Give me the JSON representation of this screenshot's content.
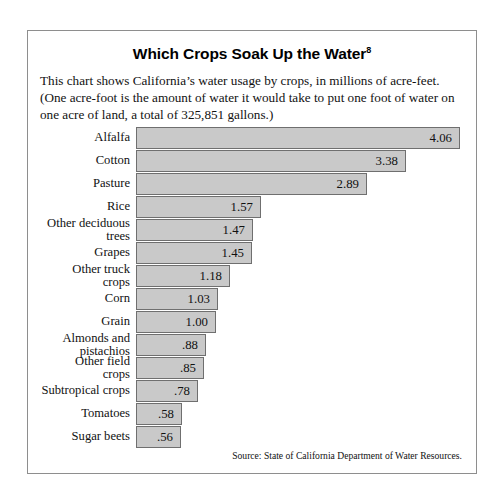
{
  "chart": {
    "title": "Which Crops Soak Up the Water",
    "title_superscript": "8",
    "subtitle": "This chart shows California’s water usage by crops, in millions of acre-feet. (One acre-foot is the amount of water it would take to put one foot of water on one acre of land, a total of 325,851 gallons.)",
    "source": "Source: State of California Department of Water Resources."
  },
  "chart_data": {
    "type": "bar",
    "orientation": "horizontal",
    "title": "Which Crops Soak Up the Water",
    "xlabel": "",
    "ylabel": "",
    "unit": "millions of acre-feet",
    "grid": false,
    "legend": "none",
    "xlim": [
      0,
      4.06
    ],
    "categories": [
      "Alfalfa",
      "Cotton",
      "Pasture",
      "Rice",
      "Other deciduous\ntrees",
      "Grapes",
      "Other truck\ncrops",
      "Corn",
      "Grain",
      "Almonds and\npistachios",
      "Other field\ncrops",
      "Subtropical crops",
      "Tomatoes",
      "Sugar beets"
    ],
    "values": [
      4.06,
      3.38,
      2.89,
      1.57,
      1.47,
      1.45,
      1.18,
      1.03,
      1.0,
      0.88,
      0.85,
      0.78,
      0.58,
      0.56
    ],
    "value_labels": [
      "4.06",
      "3.38",
      "2.89",
      "1.57",
      "1.47",
      "1.45",
      "1.18",
      "1.03",
      "1.00",
      ".88",
      ".85",
      ".78",
      ".58",
      ".56"
    ],
    "colors": {
      "bar_fill": "#c9c9c9",
      "bar_border": "#6f6f6f",
      "frame": "#8e8e8e",
      "text": "#111111",
      "background": "#ffffff"
    }
  }
}
